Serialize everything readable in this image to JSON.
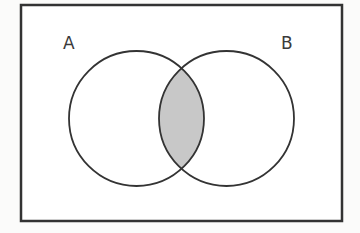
{
  "diagram": {
    "type": "venn",
    "universe": {
      "x": 21,
      "y": 5,
      "width": 321,
      "height": 216,
      "stroke": "#333333",
      "stroke_width": 2.5,
      "fill": "#ffffff"
    },
    "sets": [
      {
        "id": "A",
        "label": "A",
        "cx": 136.5,
        "cy": 118.5,
        "r": 67.5
      },
      {
        "id": "B",
        "label": "B",
        "cx": 226.5,
        "cy": 118.5,
        "r": 67.5
      }
    ],
    "shaded_region": "A ∩ B",
    "colors": {
      "stroke": "#333333",
      "shade": "#c8c8c8",
      "background": "#fbfbfa"
    }
  },
  "labels": {
    "set_a": "A",
    "set_b": "B"
  }
}
